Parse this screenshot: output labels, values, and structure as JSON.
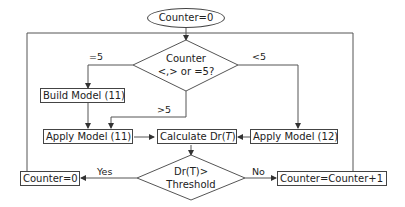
{
  "flowchart": {
    "start": {
      "label": "Counter=0"
    },
    "decision_counter": {
      "line1": "Counter",
      "line2": "<,> or =5?"
    },
    "branch_labels": {
      "eq5": "=5",
      "lt5": "<5",
      "gt5": ">5"
    },
    "build_model": {
      "label": "Build Model (11)"
    },
    "apply_model_11": {
      "label": "Apply Model (11)"
    },
    "calculate": {
      "label_prefix": "Calculate Dr(",
      "label_var": "T",
      "label_suffix": ")"
    },
    "apply_model_12": {
      "label": "Apply Model (12)"
    },
    "decision_threshold": {
      "line1": "Dr(T)>",
      "line2": "Threshold"
    },
    "yes_label": "Yes",
    "no_label": "No",
    "reset_counter": {
      "label": "Counter=0"
    },
    "increment_counter": {
      "label": "Counter=Counter+1"
    }
  },
  "colors": {
    "line": "#444444",
    "background": "#ffffff"
  }
}
